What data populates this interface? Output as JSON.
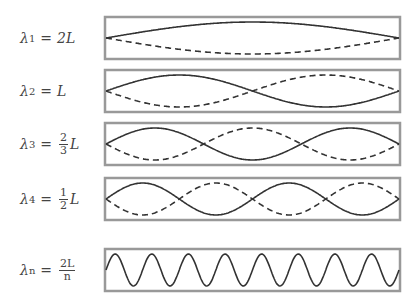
{
  "modes": [
    {
      "label_lhs": "λ",
      "sub": "1",
      "rhs": "2L",
      "harmonic": 1
    },
    {
      "label_lhs": "λ",
      "sub": "2",
      "rhs": "L",
      "harmonic": 2
    },
    {
      "label_lhs": "λ",
      "sub": "3",
      "frac_num": "2",
      "frac_den": "3",
      "rhs": "L",
      "harmonic": 3
    },
    {
      "label_lhs": "λ",
      "sub": "4",
      "frac_num": "1",
      "frac_den": "2",
      "rhs": "L",
      "harmonic": 4
    },
    {
      "label_lhs": "λ",
      "sub": "n",
      "frac_num": "2L",
      "frac_den": "n",
      "rhs": "",
      "harmonic": 16
    }
  ],
  "eq": "="
}
